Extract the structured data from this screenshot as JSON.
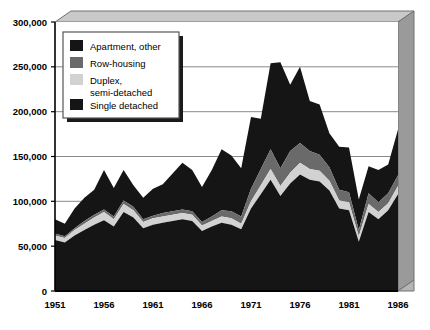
{
  "chart_data": {
    "type": "area",
    "stacked": true,
    "title": "",
    "subtitle": "",
    "xlabel": "",
    "ylabel": "",
    "ylim": [
      0,
      300000
    ],
    "xlim": [
      1951,
      1986
    ],
    "grid": true,
    "grid_axis": "y",
    "legend_position": "upper-left-inside",
    "ytick_labels": [
      "0",
      "50,000",
      "100,000",
      "150,000",
      "200,000",
      "250,000",
      "300,000"
    ],
    "ytick_values": [
      0,
      50000,
      100000,
      150000,
      200000,
      250000,
      300000
    ],
    "xtick_labels": [
      "1951",
      "1956",
      "1961",
      "1966",
      "1971",
      "1976",
      "1981",
      "1986"
    ],
    "xtick_values": [
      1951,
      1956,
      1961,
      1966,
      1971,
      1976,
      1981,
      1986
    ],
    "x": [
      1951,
      1952,
      1953,
      1954,
      1955,
      1956,
      1957,
      1958,
      1959,
      1960,
      1961,
      1962,
      1963,
      1964,
      1965,
      1966,
      1967,
      1968,
      1969,
      1970,
      1971,
      1972,
      1973,
      1974,
      1975,
      1976,
      1977,
      1978,
      1979,
      1980,
      1981,
      1982,
      1983,
      1984,
      1985,
      1986
    ],
    "series": [
      {
        "name": "Single detached",
        "color": "#151515",
        "order": 1,
        "values": [
          57000,
          54000,
          62000,
          68000,
          74000,
          79000,
          72000,
          88000,
          82000,
          70000,
          74000,
          76000,
          78000,
          80000,
          78000,
          67000,
          72000,
          76000,
          74000,
          69000,
          92000,
          108000,
          124000,
          106000,
          120000,
          130000,
          124000,
          122000,
          112000,
          92000,
          90000,
          55000,
          88000,
          80000,
          90000,
          108000
        ]
      },
      {
        "name": "Duplex, semi-detached",
        "color": "#d2d2d2",
        "order": 2,
        "values": [
          5000,
          5000,
          6000,
          7000,
          8000,
          9000,
          8000,
          9000,
          8000,
          7000,
          7000,
          7000,
          7000,
          7000,
          7000,
          6000,
          6000,
          7000,
          7000,
          6000,
          8000,
          10000,
          12000,
          11000,
          12000,
          13000,
          12000,
          12000,
          11000,
          9000,
          9000,
          6000,
          9000,
          8000,
          8000,
          9000
        ]
      },
      {
        "name": "Row-housing",
        "color": "#6a6a6a",
        "order": 3,
        "values": [
          2000,
          2000,
          2000,
          3000,
          3000,
          3000,
          3000,
          4000,
          4000,
          3000,
          3000,
          4000,
          4000,
          4000,
          4000,
          4000,
          5000,
          7000,
          8000,
          8000,
          14000,
          18000,
          22000,
          20000,
          24000,
          22000,
          20000,
          18000,
          15000,
          12000,
          11000,
          7000,
          12000,
          11000,
          11000,
          12000
        ]
      },
      {
        "name": "Apartment, other",
        "color": "#151515",
        "order": 4,
        "values": [
          16000,
          14000,
          22000,
          26000,
          28000,
          44000,
          32000,
          34000,
          24000,
          24000,
          30000,
          32000,
          42000,
          52000,
          46000,
          39000,
          52000,
          68000,
          62000,
          54000,
          80000,
          56000,
          96000,
          118000,
          74000,
          85000,
          56000,
          56000,
          38000,
          48000,
          50000,
          34000,
          30000,
          36000,
          32000,
          51000
        ]
      }
    ],
    "totals": [
      80000,
      75000,
      92000,
      104000,
      113000,
      135000,
      115000,
      135000,
      118000,
      104000,
      114000,
      119000,
      131000,
      143000,
      135000,
      116000,
      135000,
      158000,
      151000,
      137000,
      194000,
      192000,
      254000,
      255000,
      230000,
      250000,
      212000,
      208000,
      176000,
      161000,
      160000,
      102000,
      139000,
      135000,
      141000,
      180000
    ]
  },
  "legend": {
    "items": [
      {
        "label": "Apartment, other",
        "color": "#151515"
      },
      {
        "label": "Row-housing",
        "color": "#6a6a6a"
      },
      {
        "label": "Duplex,",
        "label2": "semi-detached",
        "color": "#d2d2d2"
      },
      {
        "label": "Single detached",
        "color": "#151515"
      }
    ],
    "duplex_line1": "Duplex,",
    "duplex_line2": "semi-detached"
  },
  "axes": {
    "y_labels": [
      "300,000",
      "250,000",
      "200,000",
      "150,000",
      "100,000",
      "50,000",
      "0"
    ],
    "x_labels": [
      "1951",
      "1956",
      "1961",
      "1966",
      "1971",
      "1976",
      "1981",
      "1986"
    ]
  },
  "style": {
    "frame_top_color": "#c8c8c8",
    "frame_side_color": "#999999",
    "frame_line_color": "#6b6b6b",
    "plot_bg": "#ffffff",
    "grid_color": "#8a8a8a",
    "axis_color": "#000000",
    "legend_bg": "#ffffff",
    "legend_border": "#555555",
    "legend_shadow": "#1a1a1a"
  }
}
